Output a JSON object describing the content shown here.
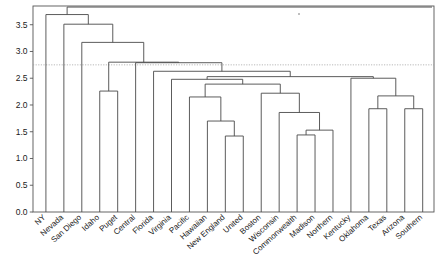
{
  "chart_data": {
    "type": "dendrogram",
    "title": "",
    "xlabel": "",
    "ylabel": "",
    "ylim": [
      0.0,
      3.85
    ],
    "grid": false,
    "legend": null,
    "y_ticks": [
      "0.0",
      "0.5",
      "1.0",
      "1.5",
      "2.0",
      "2.5",
      "3.0",
      "3.5"
    ],
    "y_tick_values": [
      0.0,
      0.5,
      1.0,
      1.5,
      2.0,
      2.5,
      3.0,
      3.5
    ],
    "leaf_labels": [
      "NY",
      "Nevada",
      "San Diego",
      "Idaho",
      "Puget",
      "Central",
      "Florida",
      "Virginia",
      "Pacific",
      "Hawaiian",
      "New England",
      "United",
      "Boston",
      "Wisconsin",
      "Commonwealth",
      "Madison",
      "Northern",
      "Kentucky",
      "Oklahoma",
      "Texas",
      "Arizona",
      "Southern"
    ],
    "leaf_count": 22,
    "cut_line": {
      "value": 2.75,
      "style": "dotted",
      "orientation": "horizontal"
    },
    "merges": [
      {
        "id": "m1",
        "left": "New England",
        "right": "United",
        "height": 1.42
      },
      {
        "id": "m2",
        "left": "Commonwealth",
        "right": "Madison",
        "height": 1.44
      },
      {
        "id": "m3",
        "left": "Commonwealth-Madison",
        "right": "Northern",
        "height": 1.53
      },
      {
        "id": "m4",
        "left": "Hawaiian",
        "right": "m1",
        "height": 1.7
      },
      {
        "id": "m5",
        "left": "Wisconsin",
        "right": "m3",
        "height": 1.86
      },
      {
        "id": "m6",
        "left": "Oklahoma",
        "right": "Texas",
        "height": 1.93
      },
      {
        "id": "m7",
        "left": "Arizona",
        "right": "Southern",
        "height": 1.93
      },
      {
        "id": "m8",
        "left": "Pacific",
        "right": "m4",
        "height": 2.15
      },
      {
        "id": "m9",
        "left": "m6",
        "right": "m7",
        "height": 2.17
      },
      {
        "id": "m10",
        "left": "Boston",
        "right": "m5",
        "height": 2.22
      },
      {
        "id": "m11",
        "left": "Idaho",
        "right": "Puget",
        "height": 2.26
      },
      {
        "id": "m12",
        "left": "m8",
        "right": "m10",
        "height": 2.39
      },
      {
        "id": "m13",
        "left": "Virginia",
        "right": "m12",
        "height": 2.48
      },
      {
        "id": "m14",
        "left": "Kentucky",
        "right": "m9",
        "height": 2.5
      },
      {
        "id": "m15",
        "left": "m13",
        "right": "m14",
        "height": 2.53
      },
      {
        "id": "m16",
        "left": "Florida",
        "right": "m15",
        "height": 2.63
      },
      {
        "id": "m17",
        "left": "Central",
        "right": "m16",
        "height": 2.79
      },
      {
        "id": "m18",
        "left": "m11",
        "right": "m17",
        "height": 2.8
      },
      {
        "id": "m19",
        "left": "San Diego",
        "right": "m18",
        "height": 3.17
      },
      {
        "id": "m20",
        "left": "Nevada",
        "right": "m19",
        "height": 3.51
      },
      {
        "id": "m21",
        "left": "NY",
        "right": "m20",
        "height": 3.69
      },
      {
        "id": "root",
        "left": "m21",
        "right": null,
        "height": 3.83
      }
    ],
    "leaf_heights": [
      {
        "leaf": "NY",
        "merge_height": 3.69
      },
      {
        "leaf": "Nevada",
        "merge_height": 3.51
      },
      {
        "leaf": "San Diego",
        "merge_height": 3.17
      },
      {
        "leaf": "Idaho",
        "merge_height": 2.26
      },
      {
        "leaf": "Puget",
        "merge_height": 2.26
      },
      {
        "leaf": "Central",
        "merge_height": 2.79
      },
      {
        "leaf": "Florida",
        "merge_height": 2.63
      },
      {
        "leaf": "Virginia",
        "merge_height": 2.48
      },
      {
        "leaf": "Pacific",
        "merge_height": 2.15
      },
      {
        "leaf": "Hawaiian",
        "merge_height": 1.7
      },
      {
        "leaf": "New England",
        "merge_height": 1.42
      },
      {
        "leaf": "United",
        "merge_height": 1.42
      },
      {
        "leaf": "Boston",
        "merge_height": 2.22
      },
      {
        "leaf": "Wisconsin",
        "merge_height": 1.86
      },
      {
        "leaf": "Commonwealth",
        "merge_height": 1.44
      },
      {
        "leaf": "Madison",
        "merge_height": 1.44
      },
      {
        "leaf": "Northern",
        "merge_height": 1.53
      },
      {
        "leaf": "Kentucky",
        "merge_height": 2.5
      },
      {
        "leaf": "Oklahoma",
        "merge_height": 1.93
      },
      {
        "leaf": "Texas",
        "merge_height": 1.93
      },
      {
        "leaf": "Arizona",
        "merge_height": 1.93
      },
      {
        "leaf": "Southern",
        "merge_height": 1.93
      }
    ]
  },
  "colors": {
    "link": "#4a4a4a",
    "frame": "#555555",
    "cut_line": "#9a9a9a",
    "text": "#1a1a1a",
    "background": "#ffffff"
  }
}
